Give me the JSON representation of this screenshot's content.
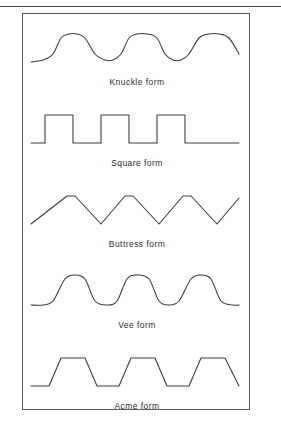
{
  "figure": {
    "background_color": "#ffffff",
    "line_color": "#3c3c3c",
    "frame_color": "#5a5a5a",
    "rule_color": "#4a4a4a",
    "width": 281,
    "height": 422
  },
  "chart_data": {
    "type": "line",
    "title": "",
    "xlabel": "",
    "ylabel": "",
    "grid": false,
    "legend": "none",
    "series": [
      {
        "name": "Knuckle form",
        "label": "Knuckle form",
        "profile": "rounded-sinusoidal",
        "cycles": 3,
        "x": [
          8,
          20,
          30,
          38,
          46,
          54,
          62,
          72,
          82,
          90,
          98,
          106,
          114,
          124,
          134,
          142,
          150,
          158,
          166,
          176,
          186,
          196,
          206,
          216
        ],
        "y": [
          38,
          36,
          30,
          14,
          10,
          10,
          14,
          30,
          36,
          36,
          30,
          14,
          10,
          10,
          14,
          30,
          36,
          36,
          30,
          14,
          10,
          10,
          14,
          30
        ]
      },
      {
        "name": "Square form",
        "label": "Square form",
        "profile": "square",
        "cycles": 3,
        "x": [
          8,
          22,
          22,
          50,
          50,
          78,
          78,
          106,
          106,
          134,
          134,
          162,
          162,
          190,
          190,
          216
        ],
        "y": [
          38,
          38,
          10,
          10,
          38,
          38,
          10,
          10,
          38,
          38,
          10,
          10,
          38,
          38,
          38,
          38
        ]
      },
      {
        "name": "Buttress form",
        "label": "Buttress form",
        "profile": "asymmetric-sawtooth",
        "cycles": 3,
        "x": [
          8,
          44,
          52,
          78,
          102,
          110,
          136,
          160,
          168,
          194,
          216
        ],
        "y": [
          38,
          10,
          10,
          38,
          10,
          10,
          38,
          10,
          10,
          38,
          12
        ]
      },
      {
        "name": "Vee form",
        "label": "Vee form",
        "profile": "rounded-vee",
        "cycles": 3,
        "x": [
          8,
          20,
          30,
          42,
          52,
          62,
          72,
          84,
          94,
          104,
          114,
          126,
          136,
          146,
          156,
          168,
          178,
          188,
          198,
          210,
          216
        ],
        "y": [
          38,
          38,
          34,
          12,
          8,
          12,
          34,
          38,
          34,
          12,
          8,
          12,
          34,
          38,
          34,
          12,
          8,
          12,
          34,
          38,
          38
        ]
      },
      {
        "name": "Acme form",
        "label": "Acme form",
        "profile": "trapezoidal",
        "cycles": 3,
        "x": [
          8,
          26,
          38,
          62,
          74,
          96,
          108,
          132,
          144,
          166,
          178,
          202,
          216
        ],
        "y": [
          38,
          38,
          10,
          10,
          38,
          38,
          10,
          10,
          38,
          38,
          10,
          10,
          38
        ]
      }
    ]
  },
  "forms": [
    {
      "label": "Knuckle form",
      "series_index": 0
    },
    {
      "label": "Square form",
      "series_index": 1
    },
    {
      "label": "Buttress form",
      "series_index": 2
    },
    {
      "label": "Vee form",
      "series_index": 3
    },
    {
      "label": "Acme form",
      "series_index": 4
    }
  ]
}
